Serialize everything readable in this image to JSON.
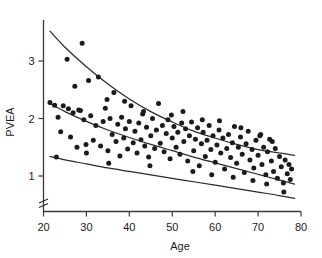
{
  "chart_data": {
    "type": "scatter",
    "title": "",
    "xlabel": "Age",
    "ylabel": "PVEA",
    "xlim": [
      20,
      80
    ],
    "ylim": [
      0.45,
      3.75
    ],
    "grid": false,
    "legend": "none",
    "axis_break": "y-axis broken below lowest plotted value",
    "xticks": [
      20,
      30,
      40,
      50,
      60,
      70,
      80
    ],
    "xtick_labels": [
      "20",
      "30",
      "40",
      "50",
      "60",
      "70",
      "80"
    ],
    "yticks": [
      1,
      2,
      3
    ],
    "ytick_labels": [
      "1",
      "2",
      "3"
    ],
    "point_color": "#1b1b1b",
    "curve_color": "#2b2b2b",
    "points": [
      [
        21.5,
        2.28
      ],
      [
        22.6,
        2.23
      ],
      [
        23.4,
        2.02
      ],
      [
        24.0,
        1.77
      ],
      [
        24.6,
        2.22
      ],
      [
        25.5,
        3.03
      ],
      [
        25.8,
        2.17
      ],
      [
        26.3,
        1.68
      ],
      [
        26.9,
        2.1
      ],
      [
        27.3,
        2.56
      ],
      [
        27.8,
        1.5
      ],
      [
        28.2,
        2.15
      ],
      [
        28.6,
        2.14
      ],
      [
        29.0,
        3.31
      ],
      [
        29.4,
        1.98
      ],
      [
        29.9,
        1.55
      ],
      [
        30.5,
        2.66
      ],
      [
        31.0,
        2.05
      ],
      [
        31.6,
        1.62
      ],
      [
        32.2,
        1.88
      ],
      [
        32.8,
        2.72
      ],
      [
        33.3,
        1.52
      ],
      [
        33.9,
        1.95
      ],
      [
        34.4,
        2.18
      ],
      [
        35.0,
        1.44
      ],
      [
        35.5,
        2.0
      ],
      [
        36.0,
        1.72
      ],
      [
        36.4,
        2.45
      ],
      [
        36.9,
        1.6
      ],
      [
        37.3,
        1.9
      ],
      [
        37.8,
        1.35
      ],
      [
        38.2,
        2.02
      ],
      [
        38.7,
        1.66
      ],
      [
        39.1,
        1.82
      ],
      [
        39.6,
        1.47
      ],
      [
        40.0,
        1.95
      ],
      [
        40.4,
        2.22
      ],
      [
        40.9,
        1.58
      ],
      [
        41.3,
        1.78
      ],
      [
        41.8,
        1.4
      ],
      [
        42.2,
        1.92
      ],
      [
        42.7,
        1.63
      ],
      [
        43.1,
        2.08
      ],
      [
        43.6,
        1.52
      ],
      [
        44.0,
        1.85
      ],
      [
        44.5,
        1.33
      ],
      [
        45.0,
        1.7
      ],
      [
        45.4,
        2.0
      ],
      [
        45.9,
        1.48
      ],
      [
        46.3,
        1.8
      ],
      [
        46.8,
        2.26
      ],
      [
        47.2,
        1.57
      ],
      [
        47.7,
        1.88
      ],
      [
        48.1,
        1.42
      ],
      [
        48.6,
        1.74
      ],
      [
        49.0,
        1.98
      ],
      [
        49.5,
        1.3
      ],
      [
        50.0,
        1.66
      ],
      [
        50.4,
        1.86
      ],
      [
        50.9,
        1.5
      ],
      [
        51.3,
        1.76
      ],
      [
        51.8,
        1.38
      ],
      [
        52.2,
        1.92
      ],
      [
        52.7,
        1.6
      ],
      [
        53.1,
        1.82
      ],
      [
        53.6,
        1.26
      ],
      [
        54.0,
        1.7
      ],
      [
        54.5,
        1.94
      ],
      [
        55.0,
        1.44
      ],
      [
        55.4,
        1.64
      ],
      [
        55.9,
        1.84
      ],
      [
        56.3,
        1.18
      ],
      [
        56.8,
        1.56
      ],
      [
        57.2,
        1.76
      ],
      [
        57.7,
        1.34
      ],
      [
        58.1,
        1.62
      ],
      [
        58.6,
        1.88
      ],
      [
        59.0,
        1.46
      ],
      [
        59.5,
        1.7
      ],
      [
        60.0,
        1.24
      ],
      [
        60.4,
        1.54
      ],
      [
        60.9,
        1.8
      ],
      [
        61.3,
        1.4
      ],
      [
        61.8,
        1.66
      ],
      [
        62.2,
        1.12
      ],
      [
        62.7,
        1.48
      ],
      [
        63.1,
        1.72
      ],
      [
        63.6,
        1.32
      ],
      [
        64.0,
        1.58
      ],
      [
        64.5,
        1.86
      ],
      [
        65.0,
        1.22
      ],
      [
        65.4,
        1.5
      ],
      [
        65.9,
        1.68
      ],
      [
        66.3,
        1.38
      ],
      [
        66.8,
        1.06
      ],
      [
        67.2,
        1.56
      ],
      [
        67.7,
        1.78
      ],
      [
        68.1,
        1.28
      ],
      [
        68.6,
        1.46
      ],
      [
        69.0,
        1.14
      ],
      [
        69.5,
        1.62
      ],
      [
        70.0,
        1.36
      ],
      [
        70.4,
        1.7
      ],
      [
        70.9,
        1.2
      ],
      [
        71.3,
        1.5
      ],
      [
        71.8,
        1.02
      ],
      [
        72.2,
        1.42
      ],
      [
        72.7,
        1.64
      ],
      [
        73.1,
        1.26
      ],
      [
        73.6,
        1.08
      ],
      [
        74.0,
        1.48
      ],
      [
        74.5,
        0.96
      ],
      [
        75.0,
        1.34
      ],
      [
        75.4,
        1.16
      ],
      [
        75.9,
        0.88
      ],
      [
        76.3,
        1.28
      ],
      [
        76.8,
        1.04
      ],
      [
        77.2,
        1.2
      ],
      [
        77.5,
        0.94
      ],
      [
        77.8,
        1.12
      ],
      [
        34.8,
        2.33
      ],
      [
        38.9,
        2.3
      ],
      [
        43.3,
        2.12
      ],
      [
        49.8,
        2.06
      ],
      [
        52.5,
        2.12
      ],
      [
        57.0,
        1.98
      ],
      [
        61.0,
        1.96
      ],
      [
        66.0,
        1.84
      ],
      [
        70.6,
        1.72
      ],
      [
        73.3,
        1.6
      ],
      [
        23.0,
        1.33
      ],
      [
        30.0,
        1.4
      ],
      [
        35.2,
        1.22
      ],
      [
        44.8,
        1.18
      ],
      [
        54.8,
        1.08
      ],
      [
        59.2,
        1.02
      ],
      [
        64.2,
        0.98
      ],
      [
        68.8,
        0.92
      ],
      [
        72.0,
        0.86
      ],
      [
        76.0,
        0.72
      ]
    ],
    "curves": [
      {
        "name": "upper-percentile-curve",
        "points": [
          [
            21.5,
            3.52
          ],
          [
            25,
            3.24
          ],
          [
            30,
            2.9
          ],
          [
            35,
            2.6
          ],
          [
            40,
            2.34
          ],
          [
            45,
            2.12
          ],
          [
            50,
            1.94
          ],
          [
            55,
            1.78
          ],
          [
            60,
            1.66
          ],
          [
            65,
            1.55
          ],
          [
            70,
            1.46
          ],
          [
            75,
            1.4
          ],
          [
            78.5,
            1.36
          ]
        ]
      },
      {
        "name": "median-curve",
        "points": [
          [
            21.5,
            2.26
          ],
          [
            25,
            2.12
          ],
          [
            30,
            1.95
          ],
          [
            35,
            1.8
          ],
          [
            40,
            1.67
          ],
          [
            45,
            1.55
          ],
          [
            50,
            1.44
          ],
          [
            55,
            1.33
          ],
          [
            60,
            1.23
          ],
          [
            65,
            1.13
          ],
          [
            70,
            1.03
          ],
          [
            75,
            0.93
          ],
          [
            78.5,
            0.86
          ]
        ]
      },
      {
        "name": "lower-percentile-curve",
        "points": [
          [
            21.5,
            1.34
          ],
          [
            25,
            1.28
          ],
          [
            30,
            1.21
          ],
          [
            35,
            1.14
          ],
          [
            40,
            1.08
          ],
          [
            45,
            1.02
          ],
          [
            50,
            0.96
          ],
          [
            55,
            0.9
          ],
          [
            60,
            0.84
          ],
          [
            65,
            0.78
          ],
          [
            70,
            0.72
          ],
          [
            75,
            0.66
          ],
          [
            78.5,
            0.61
          ]
        ]
      }
    ]
  }
}
